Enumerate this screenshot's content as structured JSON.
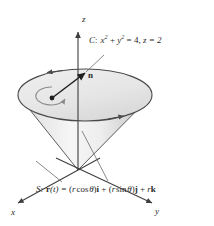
{
  "figure": {
    "axes": {
      "z_label": "z",
      "x_label": "x",
      "y_label": "y"
    },
    "vector_label": "n",
    "curve_label": {
      "name": "C",
      "separator": ":",
      "expr_x": "x",
      "expr_x_pow": "2",
      "plus": "+",
      "expr_y": "y",
      "expr_y_pow": "2",
      "equals": "= 4,",
      "z_part": "z = 2",
      "full_text": "C: x2 + y2 = 4, z = 2"
    },
    "surface_label": {
      "name": "S",
      "separator": ":",
      "r_bold": "r",
      "param": "(t) =",
      "term1_open": "(",
      "term1_r": "r",
      "term1_fn": "cos",
      "term1_theta": "θ",
      "term1_close": ")",
      "term1_unit": "i",
      "plus1": "+",
      "term2_open": "(",
      "term2_r": "r",
      "term2_fn": "sin",
      "term2_theta": "θ",
      "term2_close": ")",
      "term2_unit": "j",
      "plus2": "+",
      "term3_r": "r",
      "term3_unit": "k",
      "full_text": "S: r(t) = (r cos θ)i + (r sin θ)j + rk"
    },
    "colors": {
      "stroke": "#3d3d3d",
      "text": "#2b2b2b",
      "cone_light": "#f2f2f2",
      "cone_mid": "#dcdcdc",
      "cone_shade": "#c8c8c8",
      "disk_fill": "#ececec",
      "circulation": "#8a8a8a"
    },
    "geometry": {
      "apex": [
        78,
        170
      ],
      "ellipse_center": [
        85,
        95
      ],
      "ellipse_rx": 67,
      "ellipse_ry": 26,
      "z_axis_top": [
        78,
        28
      ],
      "normal_origin": [
        52,
        98
      ],
      "normal_tip": [
        84,
        74
      ]
    }
  }
}
